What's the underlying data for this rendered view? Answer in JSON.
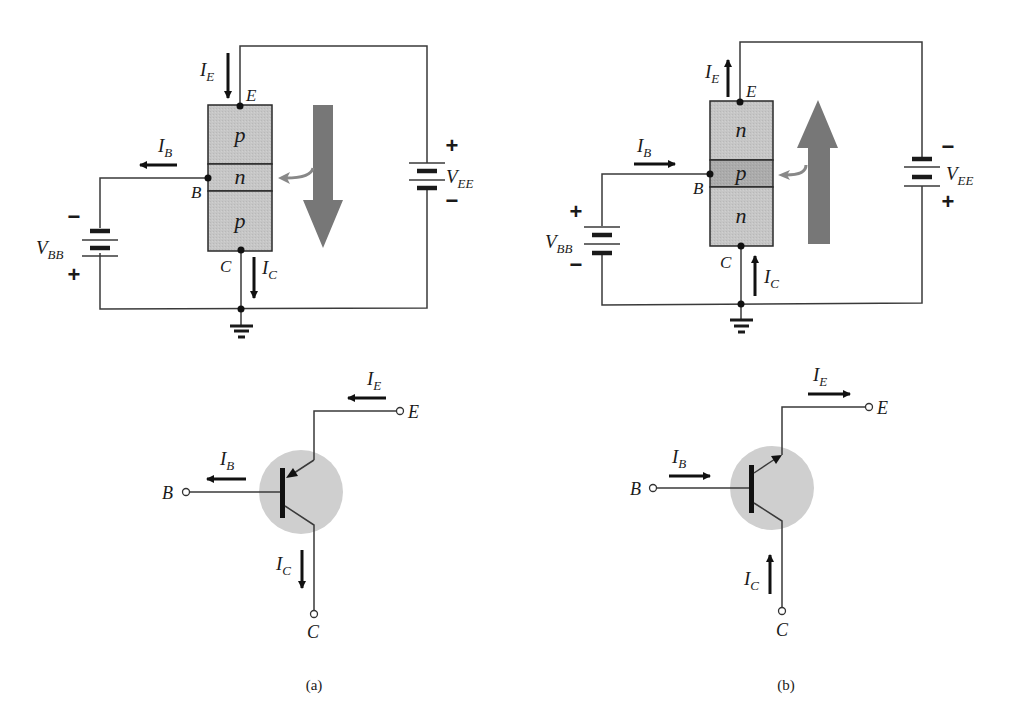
{
  "figure": {
    "colors": {
      "region_fill": "#c4c4c4",
      "region_fill_dark": "#adadad",
      "big_arrow": "#757575",
      "symbol_circle": "#cfcfcf",
      "line": "#3a3a3a"
    }
  },
  "panel_a": {
    "caption": "(a)",
    "type": "pnp",
    "regions": [
      "p",
      "n",
      "p"
    ],
    "terminals": {
      "emitter": "E",
      "base": "B",
      "collector": "C"
    },
    "currents": {
      "ie": {
        "main": "I",
        "sub": "E",
        "direction": "down"
      },
      "ib": {
        "main": "I",
        "sub": "B",
        "direction": "left"
      },
      "ic": {
        "main": "I",
        "sub": "C",
        "direction": "down"
      }
    },
    "sources": {
      "vbb": {
        "main": "V",
        "sub": "BB",
        "top_sign": "−",
        "bottom_sign": "+"
      },
      "vee": {
        "main": "V",
        "sub": "EE",
        "top_sign": "+",
        "bottom_sign": "−"
      }
    },
    "flow_arrow": "down",
    "symbol": {
      "terminals": {
        "emitter": "E",
        "base": "B",
        "collector": "C"
      },
      "currents": {
        "ie": {
          "main": "I",
          "sub": "E",
          "direction": "left"
        },
        "ib": {
          "main": "I",
          "sub": "B",
          "direction": "left"
        },
        "ic": {
          "main": "I",
          "sub": "C",
          "direction": "down"
        }
      },
      "emitter_arrow": "inward"
    }
  },
  "panel_b": {
    "caption": "(b)",
    "type": "npn",
    "regions": [
      "n",
      "p",
      "n"
    ],
    "terminals": {
      "emitter": "E",
      "base": "B",
      "collector": "C"
    },
    "currents": {
      "ie": {
        "main": "I",
        "sub": "E",
        "direction": "up"
      },
      "ib": {
        "main": "I",
        "sub": "B",
        "direction": "right"
      },
      "ic": {
        "main": "I",
        "sub": "C",
        "direction": "up"
      }
    },
    "sources": {
      "vbb": {
        "main": "V",
        "sub": "BB",
        "top_sign": "+",
        "bottom_sign": "−"
      },
      "vee": {
        "main": "V",
        "sub": "EE",
        "top_sign": "−",
        "bottom_sign": "+"
      }
    },
    "flow_arrow": "up",
    "symbol": {
      "terminals": {
        "emitter": "E",
        "base": "B",
        "collector": "C"
      },
      "currents": {
        "ie": {
          "main": "I",
          "sub": "E",
          "direction": "right"
        },
        "ib": {
          "main": "I",
          "sub": "B",
          "direction": "right"
        },
        "ic": {
          "main": "I",
          "sub": "C",
          "direction": "up"
        }
      },
      "emitter_arrow": "outward"
    }
  }
}
